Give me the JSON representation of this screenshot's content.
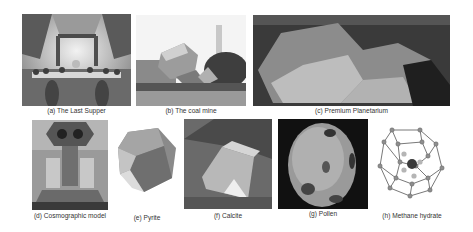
{
  "figure": {
    "panels": [
      {
        "id": "a",
        "caption": "(a) The Last Supper"
      },
      {
        "id": "b",
        "caption": "(b) The coal mine"
      },
      {
        "id": "c",
        "caption": "(c) Premium Planetarium"
      },
      {
        "id": "d",
        "caption": "(d) Cosmographic model"
      },
      {
        "id": "e",
        "caption": "(e) Pyrite"
      },
      {
        "id": "f",
        "caption": "(f) Calcite"
      },
      {
        "id": "g",
        "caption": "(g) Pollen"
      },
      {
        "id": "h",
        "caption": "(h) Methane hydrate"
      }
    ]
  }
}
